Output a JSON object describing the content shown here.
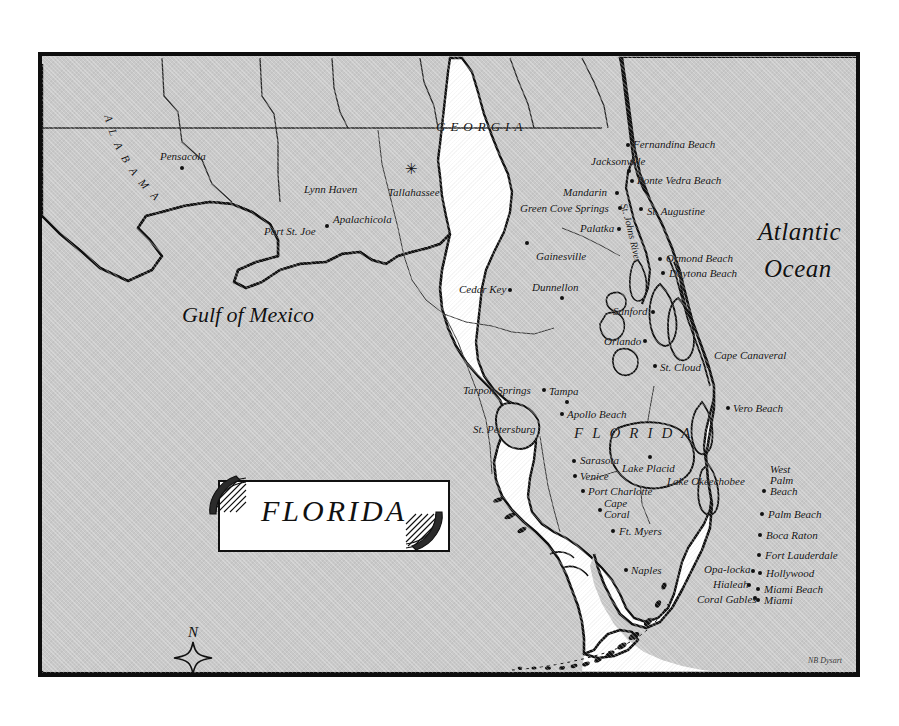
{
  "map": {
    "title": "FLORIDA",
    "frame": {
      "border_color": "#0e0e0e"
    },
    "water_color": "#c9c9c9",
    "land_color": "#ffffff",
    "attribution": "NB Dysart"
  },
  "water_labels": [
    {
      "name": "gulf-of-mexico-label",
      "line1": "Gulf of Mexico",
      "x": 140,
      "y": 248
    },
    {
      "name": "atlantic-ocean-label",
      "line1": "Atlantic",
      "line2": "Ocean",
      "x": 716,
      "y": 163
    }
  ],
  "state_labels": [
    {
      "name": "alabama-label",
      "text": "ALABAMA"
    },
    {
      "name": "georgia-label",
      "text": "GEORGIA"
    },
    {
      "name": "florida-label",
      "text": "FLORIDA"
    }
  ],
  "capital": {
    "name": "Tallahassee",
    "marker": "star"
  },
  "river_label": {
    "text": "St. Johns River"
  },
  "lake_label": {
    "text": "Lake Okeechobee"
  },
  "cities": [
    {
      "label": "Pensacola",
      "lx": 118,
      "ly": 95,
      "dx": 138,
      "dy": 110,
      "align": "left",
      "dot": true
    },
    {
      "label": "Lynn Haven",
      "lx": 262,
      "ly": 128,
      "dx": 302,
      "dy": 140,
      "align": "left",
      "dot": false
    },
    {
      "label": "Port St. Joe",
      "lx": 222,
      "ly": 170,
      "dx": 283,
      "dy": 168,
      "align": "left",
      "dot": true
    },
    {
      "label": "Apalachicola",
      "lx": 291,
      "ly": 158,
      "dx": 330,
      "dy": 175,
      "align": "left",
      "dot": false
    },
    {
      "label": "Tallahassee",
      "lx": 346,
      "ly": 131,
      "dx": 366,
      "dy": 114,
      "align": "left",
      "dot": false
    },
    {
      "label": "Cedar Key",
      "lx": 417,
      "ly": 228,
      "dx": 466,
      "dy": 232,
      "align": "left",
      "dot": true
    },
    {
      "label": "Dunnellon",
      "lx": 490,
      "ly": 226,
      "dx": 518,
      "dy": 240,
      "align": "left",
      "dot": true
    },
    {
      "label": "Gainesville",
      "lx": 494,
      "ly": 195,
      "dx": 483,
      "dy": 185,
      "align": "left",
      "dot": true
    },
    {
      "label": "Palatka",
      "lx": 538,
      "ly": 167,
      "dx": 575,
      "dy": 171,
      "align": "left",
      "dot": true
    },
    {
      "label": "Green Cove Springs",
      "lx": 478,
      "ly": 147,
      "dx": 576,
      "dy": 150,
      "align": "left",
      "dot": true
    },
    {
      "label": "Mandarin",
      "lx": 521,
      "ly": 131,
      "dx": 573,
      "dy": 135,
      "align": "left",
      "dot": true
    },
    {
      "label": "Jacksonville",
      "lx": 549,
      "ly": 100,
      "dx": 585,
      "dy": 113,
      "align": "left",
      "dot": true
    },
    {
      "label": "Fernandina Beach",
      "lx": 591,
      "ly": 83,
      "dx": 584,
      "dy": 87,
      "align": "left",
      "dot": true
    },
    {
      "label": "Ponte Vedra Beach",
      "lx": 595,
      "ly": 119,
      "dx": 588,
      "dy": 123,
      "align": "left",
      "dot": true
    },
    {
      "label": "St. Augustine",
      "lx": 605,
      "ly": 150,
      "dx": 597,
      "dy": 151,
      "align": "left",
      "dot": true
    },
    {
      "label": "Ormond Beach",
      "lx": 624,
      "ly": 197,
      "dx": 616,
      "dy": 201,
      "align": "left",
      "dot": true
    },
    {
      "label": "Daytona Beach",
      "lx": 627,
      "ly": 212,
      "dx": 619,
      "dy": 215,
      "align": "left",
      "dot": true
    },
    {
      "label": "Sanford",
      "lx": 571,
      "ly": 250,
      "dx": 609,
      "dy": 254,
      "align": "left",
      "dot": true
    },
    {
      "label": "Orlando",
      "lx": 562,
      "ly": 280,
      "dx": 601,
      "dy": 283,
      "align": "left",
      "dot": true
    },
    {
      "label": "St. Cloud",
      "lx": 618,
      "ly": 306,
      "dx": 611,
      "dy": 308,
      "align": "left",
      "dot": true
    },
    {
      "label": "Cape Canaveral",
      "lx": 672,
      "ly": 294,
      "dx": 665,
      "dy": 298,
      "align": "left",
      "dot": false
    },
    {
      "label": "Vero Beach",
      "lx": 691,
      "ly": 347,
      "dx": 684,
      "dy": 350,
      "align": "left",
      "dot": true
    },
    {
      "label": "Tarpon Springs",
      "lx": 421,
      "ly": 329,
      "dx": 500,
      "dy": 332,
      "align": "left",
      "dot": true
    },
    {
      "label": "Tampa",
      "lx": 507,
      "ly": 330,
      "dx": 523,
      "dy": 344,
      "align": "left",
      "dot": true
    },
    {
      "label": "Apollo Beach",
      "lx": 525,
      "ly": 353,
      "dx": 518,
      "dy": 356,
      "align": "left",
      "dot": true
    },
    {
      "label": "St. Petersburg",
      "lx": 431,
      "ly": 368,
      "dx": 506,
      "dy": 371,
      "align": "left",
      "dot": false
    },
    {
      "label": "Sarasota",
      "lx": 538,
      "ly": 399,
      "dx": 530,
      "dy": 403,
      "align": "left",
      "dot": true
    },
    {
      "label": "Venice",
      "lx": 538,
      "ly": 415,
      "dx": 531,
      "dy": 418,
      "align": "left",
      "dot": true
    },
    {
      "label": "Port Charlotte",
      "lx": 546,
      "ly": 430,
      "dx": 539,
      "dy": 433,
      "align": "left",
      "dot": true
    },
    {
      "label": "Lake Placid",
      "lx": 580,
      "ly": 407,
      "dx": 606,
      "dy": 399,
      "align": "left",
      "dot": true
    },
    {
      "label": "Ft. Myers",
      "lx": 577,
      "ly": 470,
      "dx": 569,
      "dy": 473,
      "align": "left",
      "dot": true
    },
    {
      "label": "Naples",
      "lx": 589,
      "ly": 509,
      "dx": 582,
      "dy": 512,
      "align": "left",
      "dot": true
    },
    {
      "label": "Opa-locka",
      "lx": 662,
      "ly": 508,
      "dx": 709,
      "dy": 513,
      "align": "left",
      "dot": true
    },
    {
      "label": "Hialeah",
      "lx": 671,
      "ly": 523,
      "dx": 705,
      "dy": 527,
      "align": "left",
      "dot": true
    },
    {
      "label": "Coral Gables",
      "lx": 655,
      "ly": 538,
      "dx": 711,
      "dy": 540,
      "align": "left",
      "dot": true
    },
    {
      "label": "Miami",
      "lx": 722,
      "ly": 539,
      "dx": 714,
      "dy": 542,
      "align": "left",
      "dot": true
    },
    {
      "label": "Miami Beach",
      "lx": 722,
      "ly": 528,
      "dx": 714,
      "dy": 531,
      "align": "left",
      "dot": true
    },
    {
      "label": "Hollywood",
      "lx": 724,
      "ly": 512,
      "dx": 716,
      "dy": 515,
      "align": "left",
      "dot": true
    },
    {
      "label": "Fort Lauderdale",
      "lx": 723,
      "ly": 494,
      "dx": 715,
      "dy": 497,
      "align": "left",
      "dot": true
    },
    {
      "label": "Boca Raton",
      "lx": 724,
      "ly": 474,
      "dx": 716,
      "dy": 477,
      "align": "left",
      "dot": true
    },
    {
      "label": "Palm Beach",
      "lx": 726,
      "ly": 453,
      "dx": 718,
      "dy": 456,
      "align": "left",
      "dot": true
    },
    {
      "label": "Key West",
      "lx": 546,
      "ly": 636,
      "dx": 592,
      "dy": 644,
      "align": "left",
      "dot": false
    }
  ],
  "cities_multiline": [
    {
      "label": "West\nPalm\nBeach",
      "lx": 728,
      "ly": 408,
      "dx": 720,
      "dy": 433
    },
    {
      "label": "Cape\nCoral",
      "lx": 562,
      "ly": 442,
      "dx": 556,
      "dy": 452
    }
  ],
  "compass": {
    "label": "N",
    "shape": "four-point-star"
  },
  "scale": {
    "min": "0",
    "max": "100",
    "units": "Miles",
    "segments": 6
  }
}
